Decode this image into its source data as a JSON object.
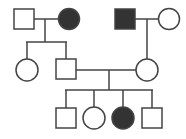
{
  "diagram": {
    "type": "pedigree",
    "colors": {
      "affected": "#333333",
      "stroke": "#444444",
      "unaffected": "#ffffff"
    },
    "generations": [
      {
        "label": "I",
        "individuals": [
          {
            "id": "I-1",
            "sex": "male",
            "affected": false
          },
          {
            "id": "I-2",
            "sex": "female",
            "affected": true
          },
          {
            "id": "I-3",
            "sex": "male",
            "affected": true
          },
          {
            "id": "I-4",
            "sex": "female",
            "affected": false
          }
        ]
      },
      {
        "label": "II",
        "individuals": [
          {
            "id": "II-1",
            "sex": "female",
            "affected": false
          },
          {
            "id": "II-2",
            "sex": "male",
            "affected": false
          },
          {
            "id": "II-3",
            "sex": "female",
            "affected": false
          }
        ]
      },
      {
        "label": "III",
        "individuals": [
          {
            "id": "III-1",
            "sex": "male",
            "affected": false
          },
          {
            "id": "III-2",
            "sex": "female",
            "affected": false
          },
          {
            "id": "III-3",
            "sex": "female",
            "affected": true
          },
          {
            "id": "III-4",
            "sex": "male",
            "affected": false
          }
        ]
      }
    ],
    "matings": [
      {
        "partners": [
          "I-1",
          "I-2"
        ],
        "children": [
          "II-1",
          "II-2"
        ]
      },
      {
        "partners": [
          "I-3",
          "I-4"
        ],
        "children": [
          "II-3"
        ]
      },
      {
        "partners": [
          "II-2",
          "II-3"
        ],
        "children": [
          "III-1",
          "III-2",
          "III-3",
          "III-4"
        ]
      }
    ]
  }
}
